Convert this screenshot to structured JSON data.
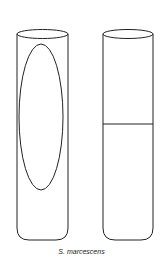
{
  "figure": {
    "caption": "S. marcescens",
    "tubes": [
      {
        "id": "left",
        "content": "vertical elliptical zone (clearing)"
      },
      {
        "id": "right",
        "content": "horizontal line at mid-height"
      }
    ],
    "colors": {
      "stroke": "#222222",
      "background": "#ffffff"
    }
  }
}
